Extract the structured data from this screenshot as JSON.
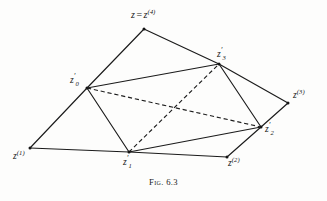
{
  "figure": {
    "caption": "Fig. 6.3",
    "background_color": "#fdfdfc",
    "stroke_color": "#1b1b1b",
    "width": 327,
    "height": 201
  },
  "vertices": [
    {
      "id": "z4",
      "label_plain": "z = z(4)",
      "base": "z",
      "equals": "=",
      "base2": "z",
      "superscript": "(4)",
      "x": 144,
      "y": 29,
      "label_x": 131,
      "label_y": 10
    },
    {
      "id": "z0p",
      "label_plain": "z'0",
      "base": "z",
      "prime": "′",
      "subscript": "0",
      "x": 87,
      "y": 88,
      "label_x": 70,
      "label_y": 76
    },
    {
      "id": "z3p",
      "label_plain": "z'3",
      "base": "z",
      "prime": "′",
      "subscript": "3",
      "x": 219,
      "y": 64,
      "label_x": 217,
      "label_y": 50
    },
    {
      "id": "z3",
      "label_plain": "z(3)",
      "base": "z",
      "superscript": "(3)",
      "x": 288,
      "y": 103,
      "label_x": 293,
      "label_y": 91
    },
    {
      "id": "z2p",
      "label_plain": "z'2",
      "base": "z",
      "prime": "′",
      "subscript": "2",
      "x": 261,
      "y": 127,
      "label_x": 265,
      "label_y": 125
    },
    {
      "id": "z1",
      "label_plain": "z(1)",
      "base": "z",
      "superscript": "(1)",
      "x": 30,
      "y": 148,
      "label_x": 13,
      "label_y": 152
    },
    {
      "id": "z1p",
      "label_plain": "z'1",
      "base": "z",
      "prime": "′",
      "subscript": "1",
      "x": 129,
      "y": 152,
      "label_x": 123,
      "label_y": 158
    },
    {
      "id": "z2",
      "label_plain": "z(2)",
      "base": "z",
      "superscript": "(2)",
      "x": 227,
      "y": 157,
      "label_x": 228,
      "label_y": 159
    }
  ],
  "edges_solid": [
    {
      "name": "edge-z4-z0p",
      "from": "z4",
      "to": "z0p",
      "x1": 144,
      "y1": 29,
      "x2": 87,
      "y2": 88
    },
    {
      "name": "edge-z4-z3p",
      "from": "z4",
      "to": "z3p",
      "x1": 144,
      "y1": 29,
      "x2": 219,
      "y2": 64
    },
    {
      "name": "edge-z0p-z3p",
      "from": "z0p",
      "to": "z3p",
      "x1": 87,
      "y1": 88,
      "x2": 219,
      "y2": 64
    },
    {
      "name": "edge-z0p-z1",
      "from": "z0p",
      "to": "z1",
      "x1": 87,
      "y1": 88,
      "x2": 30,
      "y2": 148
    },
    {
      "name": "edge-z0p-z1p",
      "from": "z0p",
      "to": "z1p",
      "x1": 87,
      "y1": 88,
      "x2": 129,
      "y2": 152
    },
    {
      "name": "edge-z3p-z3",
      "from": "z3p",
      "to": "z3",
      "x1": 219,
      "y1": 64,
      "x2": 288,
      "y2": 103
    },
    {
      "name": "edge-z3p-z2p",
      "from": "z3p",
      "to": "z2p",
      "x1": 219,
      "y1": 64,
      "x2": 261,
      "y2": 127
    },
    {
      "name": "edge-z3-z2p",
      "from": "z3",
      "to": "z2p",
      "x1": 288,
      "y1": 103,
      "x2": 261,
      "y2": 127
    },
    {
      "name": "edge-z1-z1p",
      "from": "z1",
      "to": "z1p",
      "x1": 30,
      "y1": 148,
      "x2": 129,
      "y2": 152
    },
    {
      "name": "edge-z1p-z2",
      "from": "z1p",
      "to": "z2",
      "x1": 129,
      "y1": 152,
      "x2": 227,
      "y2": 157
    },
    {
      "name": "edge-z2-z2p",
      "from": "z2",
      "to": "z2p",
      "x1": 227,
      "y1": 157,
      "x2": 261,
      "y2": 127
    },
    {
      "name": "edge-z1p-z2p",
      "from": "z1p",
      "to": "z2p",
      "x1": 129,
      "y1": 152,
      "x2": 261,
      "y2": 127
    }
  ],
  "edges_dashed": [
    {
      "name": "edge-dashed-z0p-z2p",
      "from": "z0p",
      "to": "z2p",
      "x1": 87,
      "y1": 88,
      "x2": 261,
      "y2": 127
    },
    {
      "name": "edge-dashed-z1p-z3p",
      "from": "z1p",
      "to": "z3p",
      "x1": 129,
      "y1": 152,
      "x2": 219,
      "y2": 64
    }
  ]
}
